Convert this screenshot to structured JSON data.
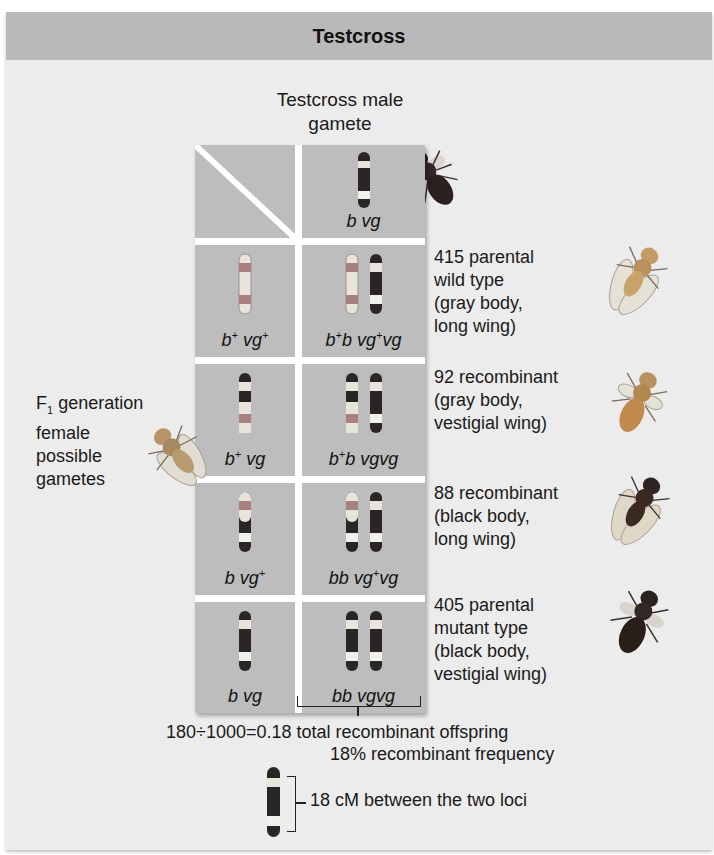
{
  "title": "Testcross",
  "male_gamete_label": [
    "Testcross male",
    "gamete"
  ],
  "female_gamete_label": {
    "line1_prefix": "F",
    "line1_sub": "1",
    "line1_suffix": " generation",
    "line2": "female",
    "line3": "possible",
    "line4": "gametes"
  },
  "column_header_genotype": {
    "a": "b",
    "b": "vg"
  },
  "rows": [
    {
      "gamete": {
        "b": "b",
        "b_sup": "+",
        "vg": "vg",
        "vg_sup": "+"
      },
      "offspring": {
        "b1": "b",
        "b1_sup": "+",
        "b2": "b",
        "vg1": "vg",
        "vg1_sup": "+",
        "vg2": "vg"
      },
      "result": {
        "count": "415",
        "line1": "415 parental",
        "line2": "wild type",
        "line3": "(gray body,",
        "line4": "long wing)"
      },
      "fly_color": "#c9a36a"
    },
    {
      "gamete": {
        "b": "b",
        "b_sup": "+",
        "vg": "vg",
        "vg_sup": ""
      },
      "offspring": {
        "b1": "b",
        "b1_sup": "+",
        "b2": "b",
        "vg1": "vg",
        "vg1_sup": "",
        "vg2": "vg"
      },
      "result": {
        "count": "92",
        "line1": "92 recombinant",
        "line2": "(gray body,",
        "line3": "vestigial wing)",
        "line4": ""
      },
      "fly_color": "#c08a4e"
    },
    {
      "gamete": {
        "b": "b",
        "b_sup": "",
        "vg": "vg",
        "vg_sup": "+"
      },
      "offspring": {
        "b1": "b",
        "b1_sup": "",
        "b2": "b",
        "vg1": "vg",
        "vg1_sup": "+",
        "vg2": "vg"
      },
      "result": {
        "count": "88",
        "line1": "88 recombinant",
        "line2": "(black body,",
        "line3": "long wing)",
        "line4": ""
      },
      "fly_color": "#3a2a22"
    },
    {
      "gamete": {
        "b": "b",
        "b_sup": "",
        "vg": "vg",
        "vg_sup": ""
      },
      "offspring": {
        "b1": "b",
        "b1_sup": "",
        "b2": "b",
        "vg1": "vg",
        "vg1_sup": "",
        "vg2": "vg"
      },
      "result": {
        "count": "405",
        "line1": "405 parental",
        "line2": "mutant type",
        "line3": "(black body,",
        "line4": "vestigial wing)"
      },
      "fly_color": "#2a1f1a"
    }
  ],
  "calculation": {
    "line1": "180÷1000=0.18 total recombinant offspring",
    "line2": "18% recombinant frequency",
    "map_distance": "18 cM between the two loci"
  },
  "colors": {
    "header_bg": "#b9b9b9",
    "panel_bg": "#ececec",
    "grid_bg": "#bdbdbd",
    "chrom_dark": "#2b2626",
    "chrom_light": "#f2f0ea",
    "chrom_wild_band": "#a88080",
    "chrom_wild_body": "#e8e4dc"
  }
}
